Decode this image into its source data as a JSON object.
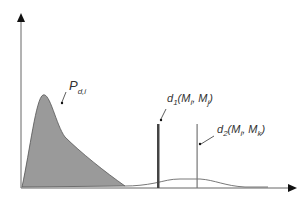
{
  "diagram": {
    "labels": {
      "p": "P",
      "p_sub": "d,i",
      "d1": "d",
      "d1_sub": "1",
      "d1_args": "(M",
      "d1_args_sub1": "i",
      "d1_mid": ", M",
      "d1_args_sub2": "j",
      "d1_end": ")",
      "d2": "d",
      "d2_sub": "2",
      "d2_args": "(M",
      "d2_args_sub1": "i",
      "d2_mid": ", M",
      "d2_args_sub2": "k",
      "d2_end": ")"
    },
    "colors": {
      "fill": "#9a9a9a",
      "line": "#444444",
      "thick_bar": "#444444",
      "thin_bar": "#777777"
    }
  }
}
